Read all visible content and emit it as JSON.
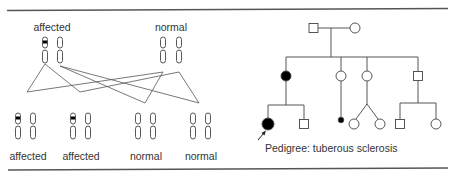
{
  "figure": {
    "colors": {
      "line": "#444444",
      "rule": "#555555",
      "fill": "#000000",
      "text": "#333333"
    }
  },
  "chromosome_diagram": {
    "parents": [
      {
        "label": "affected",
        "status": "affected"
      },
      {
        "label": "normal",
        "status": "normal"
      }
    ],
    "offspring": [
      {
        "label": "affected",
        "status": "affected"
      },
      {
        "label": "affected",
        "status": "affected"
      },
      {
        "label": "normal",
        "status": "normal"
      },
      {
        "label": "normal",
        "status": "normal"
      }
    ]
  },
  "pedigree": {
    "caption": "Pedigree: tuberous sclerosis",
    "generation_1": [
      {
        "sex": "male",
        "affected": false
      },
      {
        "sex": "female",
        "affected": false
      }
    ],
    "generation_2": [
      {
        "sex": "female",
        "affected": true
      },
      {
        "sex": "female",
        "affected": false
      },
      {
        "sex": "female",
        "affected": false
      },
      {
        "sex": "male",
        "affected": false
      }
    ],
    "generation_3": [
      {
        "sex": "female",
        "affected": true,
        "proband": true
      },
      {
        "sex": "male",
        "affected": false
      },
      {
        "sex": "unknown",
        "affected": true,
        "note": "small filled dot"
      },
      {
        "sex": "female",
        "affected": false,
        "twin": true
      },
      {
        "sex": "female",
        "affected": false,
        "twin": true
      },
      {
        "sex": "male",
        "affected": false
      },
      {
        "sex": "female",
        "affected": false
      }
    ]
  }
}
